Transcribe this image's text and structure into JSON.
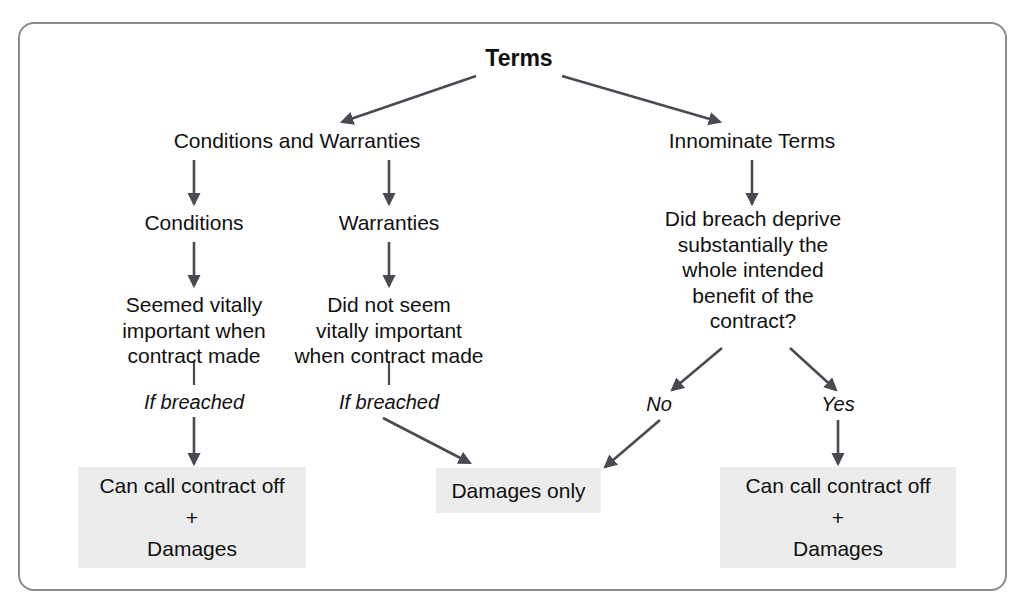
{
  "diagram": {
    "title": "Terms",
    "type": "flowchart",
    "frame": {
      "border_color": "#8a8a8a",
      "background": "#ffffff"
    },
    "palette": {
      "text": "#111111",
      "box_fill": "#ececec",
      "arrow": "#4a4a52",
      "frame_border": "#8a8a8a"
    },
    "nodes": {
      "root": "Terms",
      "branch_left": "Conditions and Warranties",
      "branch_right": "Innominate Terms",
      "conditions": "Conditions",
      "warranties": "Warranties",
      "conditions_detail": "Seemed vitally\nimportant when\ncontract made",
      "warranties_detail": "Did not seem\nvitally important\nwhen contract made",
      "innominate_question": "Did breach deprive\nsubstantially the\nwhole intended\nbenefit of the\ncontract?",
      "label_if_breached_left": "If breached",
      "label_if_breached_middle": "If breached",
      "label_no": "No",
      "label_yes": "Yes"
    },
    "outcome_boxes": [
      {
        "id": "outcome-left",
        "text": "Can call contract off\n+\nDamages"
      },
      {
        "id": "outcome-middle",
        "text": "Damages only"
      },
      {
        "id": "outcome-right",
        "text": "Can call contract off\n+\nDamages"
      }
    ]
  }
}
